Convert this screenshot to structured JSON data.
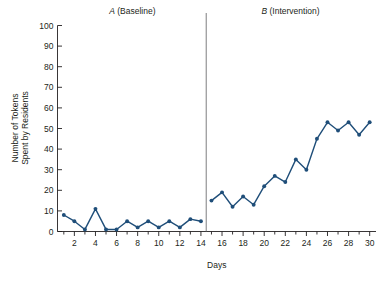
{
  "chart_data": {
    "type": "line",
    "title": "",
    "xlabel": "Days",
    "ylabel": "Number of Tokens Spent by Residents",
    "ylabel_line1": "Number of Tokens",
    "ylabel_line2": "Spent by Residents",
    "xlim": [
      0.4,
      30.6
    ],
    "ylim": [
      0,
      100
    ],
    "ytick_values": [
      0,
      10,
      20,
      30,
      40,
      50,
      60,
      70,
      80,
      90,
      100
    ],
    "ytick_labels": [
      "0",
      "10",
      "20",
      "30",
      "40",
      "50",
      "60",
      "70",
      "80",
      "90",
      "100"
    ],
    "xtick_values": [
      1,
      2,
      3,
      4,
      5,
      6,
      7,
      8,
      9,
      10,
      11,
      12,
      13,
      14,
      15,
      16,
      17,
      18,
      19,
      20,
      21,
      22,
      23,
      24,
      25,
      26,
      27,
      28,
      29,
      30
    ],
    "xtick_labeled_values": [
      2,
      4,
      6,
      8,
      10,
      12,
      14,
      16,
      18,
      20,
      22,
      24,
      26,
      28,
      30
    ],
    "xtick_labels": [
      "2",
      "4",
      "6",
      "8",
      "10",
      "12",
      "14",
      "16",
      "18",
      "20",
      "22",
      "24",
      "26",
      "28",
      "30"
    ],
    "grid": false,
    "legend": "none",
    "series_color": "#1f4e79",
    "phases": [
      {
        "id": "A",
        "letter": "A",
        "name": "(Baseline)",
        "label": "A (Baseline)",
        "x_start": 1,
        "x_end": 14,
        "label_x": 7.5
      },
      {
        "id": "B",
        "letter": "B",
        "name": "(Intervention)",
        "label": "B (Intervention)",
        "x_start": 15,
        "x_end": 30,
        "label_x": 22.5
      }
    ],
    "phase_divider_x": 14.5,
    "series": [
      {
        "name": "Tokens spent by residents",
        "color": "#1f4e79",
        "phase_a": {
          "x": [
            1,
            2,
            3,
            4,
            5,
            6,
            7,
            8,
            9,
            10,
            11,
            12,
            13,
            14
          ],
          "values": [
            8,
            5,
            1,
            11,
            1,
            2,
            2,
            6,
            2,
            7,
            2,
            6,
            2,
            7,
            5
          ]
        },
        "phase_b": {
          "x": [
            15,
            16,
            17,
            18,
            19,
            20,
            21,
            22,
            23,
            24,
            25,
            26,
            27,
            28,
            29,
            30
          ],
          "values": [
            15,
            19,
            11,
            16,
            12,
            21,
            26,
            24,
            34,
            30,
            45,
            37,
            54,
            50,
            53,
            47,
            53,
            52
          ]
        }
      }
    ],
    "points": [
      {
        "day": 1,
        "value": 8,
        "phase": "A"
      },
      {
        "day": 2,
        "value": 5,
        "phase": "A"
      },
      {
        "day": 3,
        "value": 1,
        "phase": "A"
      },
      {
        "day": 4,
        "value": 11,
        "phase": "A"
      },
      {
        "day": 5,
        "value": 1,
        "phase": "A"
      },
      {
        "day": 6,
        "value": 1,
        "phase": "A"
      },
      {
        "day": 7,
        "value": 5,
        "phase": "A"
      },
      {
        "day": 8,
        "value": 2,
        "phase": "A"
      },
      {
        "day": 9,
        "value": 5,
        "phase": "A"
      },
      {
        "day": 10,
        "value": 2,
        "phase": "A"
      },
      {
        "day": 11,
        "value": 5,
        "phase": "A"
      },
      {
        "day": 12,
        "value": 2,
        "phase": "A"
      },
      {
        "day": 13,
        "value": 6,
        "phase": "A"
      },
      {
        "day": 14,
        "value": 5,
        "phase": "A"
      },
      {
        "day": 15,
        "value": 15,
        "phase": "B"
      },
      {
        "day": 16,
        "value": 19,
        "phase": "B"
      },
      {
        "day": 17,
        "value": 12,
        "phase": "B"
      },
      {
        "day": 18,
        "value": 17,
        "phase": "B"
      },
      {
        "day": 19,
        "value": 13,
        "phase": "B"
      },
      {
        "day": 20,
        "value": 22,
        "phase": "B"
      },
      {
        "day": 21,
        "value": 27,
        "phase": "B"
      },
      {
        "day": 22,
        "value": 24,
        "phase": "B"
      },
      {
        "day": 23,
        "value": 35,
        "phase": "B"
      },
      {
        "day": 24,
        "value": 30,
        "phase": "B"
      },
      {
        "day": 25,
        "value": 45,
        "phase": "B"
      },
      {
        "day": 26,
        "value": 53,
        "phase": "B"
      },
      {
        "day": 27,
        "value": 49,
        "phase": "B"
      },
      {
        "day": 28,
        "value": 53,
        "phase": "B"
      },
      {
        "day": 29,
        "value": 47,
        "phase": "B"
      },
      {
        "day": 30,
        "value": 53,
        "phase": "B"
      }
    ]
  }
}
